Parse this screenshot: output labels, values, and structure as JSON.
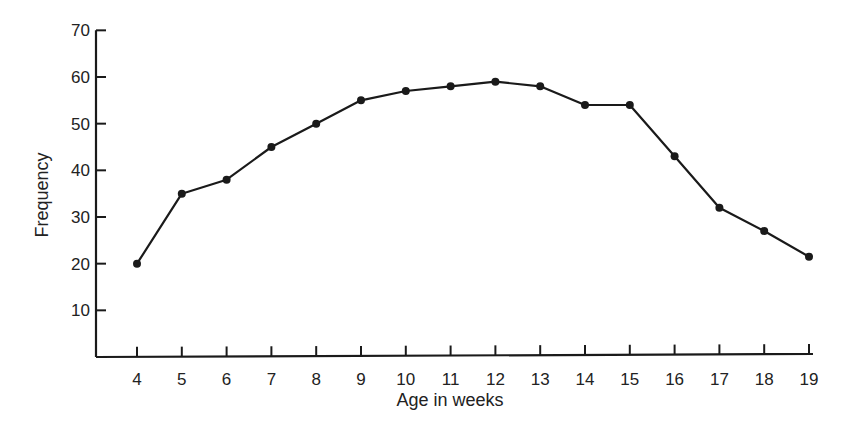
{
  "chart_data": {
    "type": "line",
    "title": "",
    "xlabel": "Age in weeks",
    "ylabel": "Frequency",
    "x": [
      4,
      5,
      6,
      7,
      8,
      9,
      10,
      11,
      12,
      13,
      14,
      15,
      16,
      17,
      18,
      19
    ],
    "series": [
      {
        "name": "Frequency",
        "values": [
          20,
          35,
          38,
          45,
          50,
          55,
          57,
          58,
          59,
          58,
          54,
          54,
          43,
          32,
          27,
          21.5
        ]
      }
    ],
    "ylim": [
      0,
      70
    ],
    "yticks": [
      10,
      20,
      30,
      40,
      50,
      60,
      70
    ],
    "xticks": [
      4,
      5,
      6,
      7,
      8,
      9,
      10,
      11,
      12,
      13,
      14,
      15,
      16,
      17,
      18,
      19
    ],
    "grid": false,
    "legend": null,
    "markers": "filled-circle",
    "line_color": "#1a1a1a"
  }
}
